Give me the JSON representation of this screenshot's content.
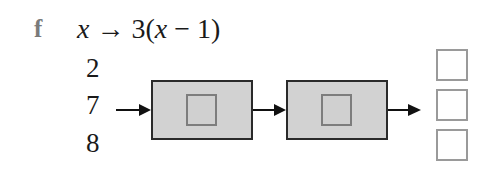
{
  "question": {
    "part_label": "f",
    "mapping": {
      "variable": "x",
      "arrow": "→",
      "rule_prefix": "3(",
      "rule_var": "x",
      "rule_suffix": " − 1)"
    },
    "inputs": [
      "2",
      "7",
      "8"
    ],
    "machines": [
      {
        "name": "first-operation",
        "answer": ""
      },
      {
        "name": "second-operation",
        "answer": ""
      }
    ],
    "outputs": [
      "",
      "",
      ""
    ]
  },
  "colors": {
    "machine_fill": "#d2d2d2",
    "machine_border": "#2a2a2a",
    "inner_box_border": "#7d7d7d",
    "output_box_border": "#9a9a9a",
    "part_label": "#7a7a7a"
  }
}
